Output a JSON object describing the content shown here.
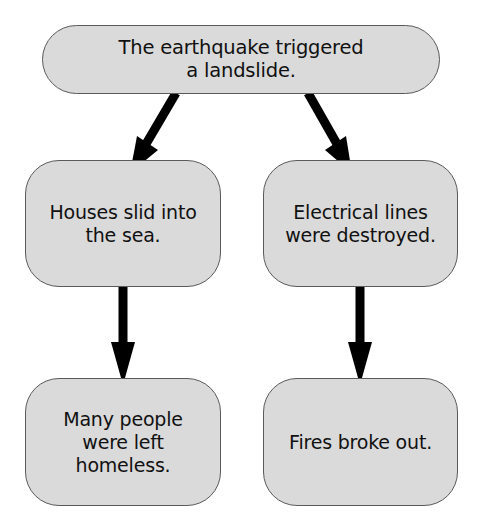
{
  "diagram": {
    "type": "cause-effect flowchart",
    "nodes": {
      "top": {
        "text": "The earthquake triggered\na landslide."
      },
      "mid_left": {
        "text": "Houses slid into\nthe sea."
      },
      "mid_right": {
        "text": "Electrical lines\nwere destroyed."
      },
      "bot_left": {
        "text": "Many people\nwere left\nhomeless."
      },
      "bot_right": {
        "text": "Fires broke out."
      }
    },
    "edges": [
      {
        "from": "top",
        "to": "mid_left"
      },
      {
        "from": "top",
        "to": "mid_right"
      },
      {
        "from": "mid_left",
        "to": "bot_left"
      },
      {
        "from": "mid_right",
        "to": "bot_right"
      }
    ],
    "colors": {
      "node_fill": "#dadada",
      "node_border": "#5a5a5a",
      "arrow": "#000000",
      "text": "#111111"
    }
  }
}
